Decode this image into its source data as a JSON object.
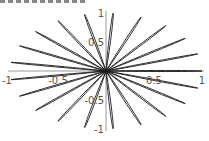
{
  "chart_data": {
    "type": "line",
    "subtype": "polar-rose",
    "title": "",
    "xlabel": "",
    "ylabel": "",
    "xlim": [
      -1,
      1
    ],
    "ylim": [
      -1,
      1
    ],
    "grid": false,
    "legend": null,
    "petal_count": 21,
    "petal_angle_offset_deg": 0,
    "petal_radius": 1,
    "x_ticks": [
      {
        "value": -1,
        "label": "-1"
      },
      {
        "value": -0.5,
        "label": "-0.5"
      },
      {
        "value": 0.5,
        "label": "0.5"
      },
      {
        "value": 1,
        "label": "1"
      }
    ],
    "y_ticks": [
      {
        "value": 1,
        "label": "1"
      },
      {
        "value": 0.5,
        "label": "0.5"
      },
      {
        "value": -0.5,
        "label": "-0.5"
      },
      {
        "value": -1,
        "label": "-1"
      }
    ],
    "colors": {
      "curve": "#1a1a1a",
      "axis": "#9a9a9a",
      "tick_label": "#555555"
    }
  },
  "layout": {
    "origin_px": [
      106,
      71
    ],
    "x_unit_px": 96,
    "y_unit_px": 58
  }
}
